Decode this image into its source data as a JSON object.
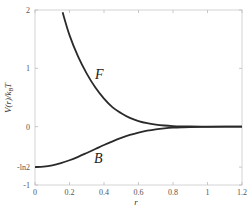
{
  "chart_data": {
    "type": "line",
    "title": "",
    "xlabel": "r",
    "ylabel": "V(r)/k_B T",
    "xlim": [
      0,
      1.2
    ],
    "ylim": [
      -1,
      2
    ],
    "grid": false,
    "legend": null,
    "x_ticks": [
      {
        "value": 0,
        "label": "0"
      },
      {
        "value": 0.2,
        "label": "0.2"
      },
      {
        "value": 0.4,
        "label": "0.4"
      },
      {
        "value": 0.6,
        "label": "0.6"
      },
      {
        "value": 0.8,
        "label": "0.8"
      },
      {
        "value": 1,
        "label": "1"
      },
      {
        "value": 1.2,
        "label": "1.2"
      }
    ],
    "y_ticks": [
      {
        "value": 2,
        "label": "2"
      },
      {
        "value": 1,
        "label": "1"
      },
      {
        "value": 0,
        "label": "0"
      },
      {
        "value": -0.6931,
        "label": "-ln2"
      },
      {
        "value": -1,
        "label": "-1"
      }
    ],
    "series": [
      {
        "name": "F",
        "description": "Fermion statistical potential",
        "x": [
          0.16,
          0.2,
          0.25,
          0.3,
          0.35,
          0.4,
          0.45,
          0.5,
          0.55,
          0.6,
          0.65,
          0.7,
          0.75,
          0.8,
          0.85,
          0.9,
          1.0,
          1.1,
          1.2
        ],
        "values": [
          1.96,
          1.57,
          1.2,
          0.91,
          0.67,
          0.48,
          0.33,
          0.23,
          0.15,
          0.096,
          0.059,
          0.035,
          0.02,
          0.011,
          0.006,
          0.003,
          0.001,
          0.0,
          0.0
        ],
        "label_position": {
          "x": 0.38,
          "y": 0.9
        }
      },
      {
        "name": "B",
        "description": "Boson statistical potential",
        "x": [
          0,
          0.05,
          0.1,
          0.15,
          0.2,
          0.25,
          0.3,
          0.35,
          0.4,
          0.45,
          0.5,
          0.55,
          0.6,
          0.65,
          0.7,
          0.75,
          0.8,
          0.85,
          0.9,
          1.0,
          1.1,
          1.2
        ],
        "values": [
          -0.693,
          -0.685,
          -0.662,
          -0.625,
          -0.576,
          -0.517,
          -0.451,
          -0.383,
          -0.315,
          -0.251,
          -0.193,
          -0.142,
          -0.101,
          -0.069,
          -0.045,
          -0.029,
          -0.018,
          -0.011,
          -0.006,
          -0.002,
          0.0,
          0.0
        ],
        "label_position": {
          "x": 0.37,
          "y": -0.55
        }
      }
    ]
  },
  "labels": {
    "x_axis": "r",
    "y_axis": "V(r)/k",
    "y_axis_sub": "B",
    "y_axis_tail": "T",
    "curve_f": "F",
    "curve_b": "B"
  },
  "colors": {
    "curve": "#2a2a2a",
    "axis_frame": "#d0d0d0",
    "tick_text": "#555555"
  }
}
